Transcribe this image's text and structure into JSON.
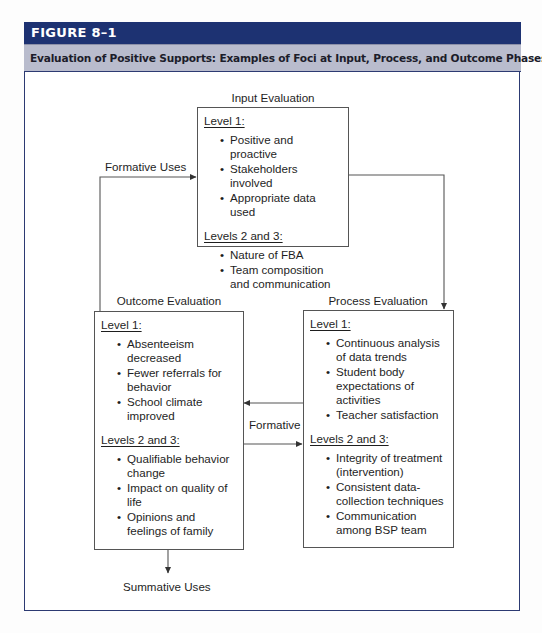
{
  "figure": {
    "number": "FIGURE 8–1",
    "title": "Evaluation of Positive Supports: Examples of Foci at Input, Process, and Outcome Phases"
  },
  "input_evaluation": {
    "title": "Input Evaluation",
    "level1_heading": "Level 1:",
    "level1_items": [
      "Positive and proactive",
      "Stakeholders involved",
      "Appropriate data used"
    ],
    "level23_heading": "Levels 2 and 3:",
    "level23_items": [
      "Nature of FBA",
      "Team composition and communication"
    ]
  },
  "process_evaluation": {
    "title": "Process Evaluation",
    "level1_heading": "Level 1:",
    "level1_items": [
      "Continuous analysis of data trends",
      "Student body expectations of activities",
      "Teacher satisfaction"
    ],
    "level23_heading": "Levels 2 and 3:",
    "level23_items": [
      "Integrity of treatment (intervention)",
      "Consistent data-collection techniques",
      "Communication among BSP team"
    ]
  },
  "outcome_evaluation": {
    "title": "Outcome Evaluation",
    "level1_heading": "Level 1:",
    "level1_items": [
      "Absenteeism decreased",
      "Fewer referrals for behavior",
      "School climate improved"
    ],
    "level23_heading": "Levels 2 and 3:",
    "level23_items": [
      "Qualifiable behavior change",
      "Impact on quality of life",
      "Opinions and feelings of family"
    ]
  },
  "connectors": {
    "formative_uses": "Formative Uses",
    "formative": "Formative",
    "summative_uses": "Summative Uses"
  },
  "colors": {
    "header_bg": "#1d3272",
    "subtitle_bg": "#b9bccd",
    "frame_border": "#2c3a72",
    "line": "#555555"
  }
}
